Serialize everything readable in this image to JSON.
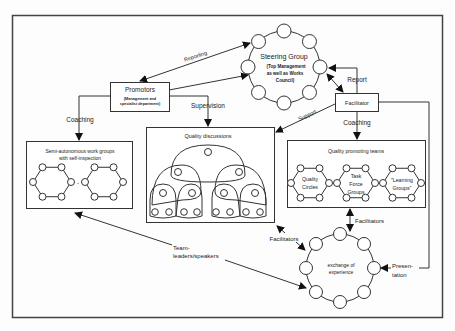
{
  "diagram": {
    "nodes": {
      "steering_group": {
        "title": "Steering Group",
        "subtitle_lines": [
          "(Top Management",
          "as well as Works",
          "Council)"
        ]
      },
      "promotors": {
        "title": "Promotors",
        "subtitle_lines": [
          "(Management and",
          "specialist department)"
        ]
      },
      "facilitator": {
        "title": "Facilitator"
      },
      "semi_autonomous": {
        "title_lines": [
          "Semi-autonomous work groups",
          "with self-inspection"
        ],
        "separator": "-"
      },
      "quality_discussions": {
        "title": "Quality discussions",
        "separator": "-"
      },
      "quality_promoting_teams": {
        "title": "Quality promoting teams",
        "groups": [
          {
            "lines": [
              "Quality",
              "Circles"
            ]
          },
          {
            "lines": [
              "Task",
              "Force",
              "Groups"
            ]
          },
          {
            "lines": [
              "\"Learning",
              "Groups\""
            ]
          }
        ]
      },
      "exchange": {
        "lines": [
          "exchange of",
          "experience"
        ]
      }
    },
    "edge_labels": {
      "reporting": "Reporting",
      "report": "Report",
      "supervision": "Supervision",
      "coaching_left": "Coaching",
      "coaching_right": "Coaching",
      "support": "Support",
      "facilitators_right": "Facilitators",
      "facilitators_center": "Facilitators",
      "team_leaders": [
        "Team-",
        "leaders/speakers"
      ],
      "presentation": [
        "Presen-",
        "tation"
      ]
    }
  }
}
